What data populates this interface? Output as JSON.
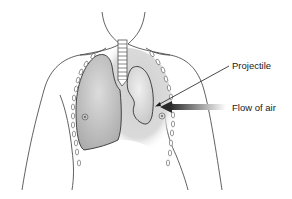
{
  "diagram": {
    "labels": {
      "projectile": "Projectile",
      "flow_of_air": "Flow of air"
    },
    "colors": {
      "outline": "#3a3a3a",
      "lung_fill": "#bdbdbd",
      "collapsed_lung_fill": "#d6d6d6",
      "air_space_fill": "#d9d9d9",
      "background": "#ffffff",
      "arrow": "#333333"
    }
  }
}
